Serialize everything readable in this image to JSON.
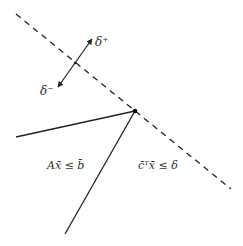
{
  "diagram": {
    "labels": {
      "delta_plus": "δ⁺",
      "delta_minus": "δ⁻",
      "feasible_region": "Ax̄ ≤ b̄",
      "objective_halfspace": "c̄ᵀx̄ ≤ δ"
    },
    "elements": {
      "dashed_line": "objective hyperplane c̄ᵀx̄ = δ",
      "solid_edges": [
        "left constraint edge",
        "lower constraint edge"
      ],
      "vertex": "optimal vertex",
      "arrow": "direction of δ increase/decrease"
    },
    "colors": {
      "stroke": "#222222",
      "background": "#ffffff"
    }
  }
}
